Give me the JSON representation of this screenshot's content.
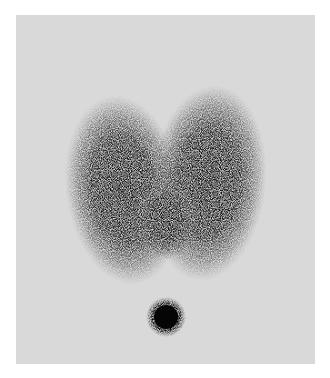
{
  "image": {
    "kind": "thyroid scintigram",
    "background_color": "#d9d9d9",
    "uptake_color": "#111111",
    "frame": {
      "x": 16,
      "y": 15,
      "width": 299,
      "height": 349
    },
    "regions": [
      {
        "name": "right-lobe",
        "cx": 110,
        "cy": 170,
        "rx": 55,
        "ry": 92
      },
      {
        "name": "left-lobe",
        "cx": 193,
        "cy": 165,
        "rx": 55,
        "ry": 95
      },
      {
        "name": "isthmus",
        "cx": 150,
        "cy": 200,
        "rx": 30,
        "ry": 35
      },
      {
        "name": "marker-dot",
        "cx": 150,
        "cy": 302,
        "r": 16
      }
    ]
  }
}
